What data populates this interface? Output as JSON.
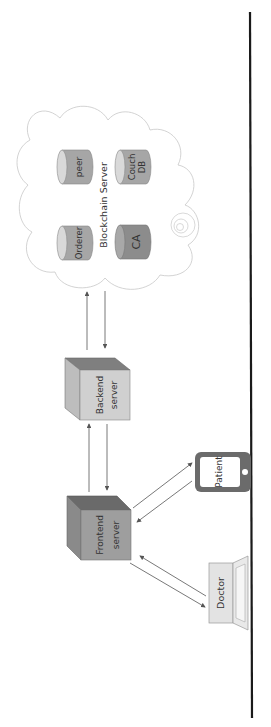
{
  "diagram": {
    "orientation": "rotated-90-ccw",
    "blockchain": {
      "title": "Blockchain Server",
      "nodes": {
        "peer": "peer",
        "couch_db_line1": "Couch",
        "couch_db_line2": "DB",
        "orderer": "Orderer",
        "ca": "CA"
      }
    },
    "backend": {
      "line1": "Backend",
      "line2": "server"
    },
    "frontend": {
      "line1": "Frontend",
      "line2": "server"
    },
    "patient": {
      "label": "Patient"
    },
    "doctor": {
      "label": "Doctor"
    },
    "colors": {
      "cylinder": "#a6a6a6",
      "cylinder_ca": "#8c8c8c",
      "cylinder_cap": "#d9d9d9",
      "backend_front": "#d0d0d0",
      "backend_top": "#7f7f7f",
      "frontend_front": "#9e9e9e",
      "frontend_top": "#6a6a6a",
      "phone": "#6b6b6b",
      "laptop": "#e3e3e3",
      "arrow": "#555555",
      "rule": "#1a1a1a"
    }
  }
}
